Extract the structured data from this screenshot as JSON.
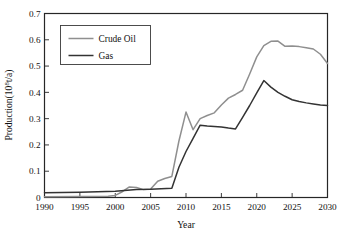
{
  "chart_data": {
    "type": "line",
    "title": "",
    "xlabel": "Year",
    "ylabel": "Production(10⁸t/a)",
    "ylabel_parts": {
      "base": "Production(10",
      "exponent": "8",
      "tail": "t/a)"
    },
    "xlim": [
      1990,
      2030
    ],
    "ylim": [
      0,
      0.7
    ],
    "xticks": [
      1990,
      1995,
      2000,
      2005,
      2010,
      2015,
      2020,
      2025,
      2030
    ],
    "xticklabels": [
      "1990",
      "1995",
      "2000",
      "2005",
      "2010",
      "2015",
      "2020",
      "2025",
      "2030"
    ],
    "yticks": [
      0,
      0.1,
      0.2,
      0.3,
      0.4,
      0.5,
      0.6,
      0.7
    ],
    "yticklabels": [
      "0",
      "0.1",
      "0.2",
      "0.3",
      "0.4",
      "0.5",
      "0.6",
      "0.7"
    ],
    "grid": false,
    "legend_position": "upper left",
    "series": [
      {
        "name": "Crude Oil",
        "color": "#8f8f8f",
        "width": 1.5,
        "x": [
          1990,
          1995,
          1999,
          2000,
          2001,
          2002,
          2003,
          2004,
          2005,
          2006,
          2007,
          2008,
          2009,
          2010,
          2011,
          2012,
          2013,
          2014,
          2015,
          2016,
          2017,
          2018,
          2019,
          2020,
          2021,
          2022,
          2023,
          2024,
          2025,
          2026,
          2027,
          2028,
          2029,
          2030
        ],
        "values": [
          0.003,
          0.004,
          0.005,
          0.008,
          0.022,
          0.04,
          0.038,
          0.03,
          0.032,
          0.062,
          0.072,
          0.08,
          0.215,
          0.325,
          0.258,
          0.3,
          0.312,
          0.322,
          0.352,
          0.378,
          0.392,
          0.408,
          0.47,
          0.535,
          0.578,
          0.594,
          0.595,
          0.575,
          0.576,
          0.574,
          0.57,
          0.565,
          0.545,
          0.51
        ]
      },
      {
        "name": "Gas",
        "color": "#333333",
        "width": 1.5,
        "x": [
          1990,
          1995,
          2000,
          2003,
          2005,
          2008,
          2009,
          2010,
          2011,
          2012,
          2013,
          2014,
          2015,
          2016,
          2017,
          2018,
          2019,
          2020,
          2021,
          2022,
          2023,
          2024,
          2025,
          2026,
          2027,
          2028,
          2029,
          2030
        ],
        "values": [
          0.018,
          0.02,
          0.024,
          0.03,
          0.031,
          0.035,
          0.115,
          0.175,
          0.225,
          0.275,
          0.272,
          0.27,
          0.268,
          0.264,
          0.261,
          0.305,
          0.35,
          0.398,
          0.445,
          0.42,
          0.4,
          0.385,
          0.372,
          0.365,
          0.36,
          0.356,
          0.352,
          0.35
        ]
      }
    ]
  },
  "legend": {
    "items": [
      {
        "label": "Crude Oil",
        "color": "#8f8f8f"
      },
      {
        "label": "Gas",
        "color": "#333333"
      }
    ]
  }
}
